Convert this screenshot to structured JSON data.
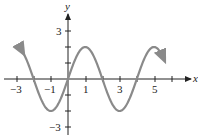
{
  "chart_data": {
    "type": "line",
    "title": "",
    "xlabel": "x",
    "ylabel": "y",
    "function": "y = 2 sin(pi x / 2)",
    "xlim": [
      -3.8,
      7.0
    ],
    "ylim": [
      -3.4,
      4.5
    ],
    "grid": false,
    "legend": null,
    "x_tick_labels": [
      "-3",
      "-1",
      "1",
      "3",
      "5"
    ],
    "x_ticks": [
      -3,
      -2,
      -1,
      0,
      1,
      2,
      3,
      4,
      5,
      6
    ],
    "y_tick_labels": [
      "3",
      "-3"
    ],
    "y_ticks": [
      -3,
      -2,
      -1,
      1,
      2,
      3
    ],
    "series": [
      {
        "name": "curve",
        "color": "#8a8a8a",
        "x": [
          -2.6,
          -2,
          -1,
          0,
          1,
          2,
          3,
          4,
          5,
          5.6
        ],
        "y": [
          1.62,
          0,
          -2,
          0,
          2,
          0,
          -2,
          0,
          2,
          1.62
        ]
      }
    ],
    "arrows_at_ends": true
  },
  "labels": {
    "x_axis": "x",
    "y_axis": "y",
    "xt_m3": "−3",
    "xt_m1": "−1",
    "xt_1": "1",
    "xt_3": "3",
    "xt_5": "5",
    "yt_3": "3",
    "yt_m3": "−3"
  }
}
